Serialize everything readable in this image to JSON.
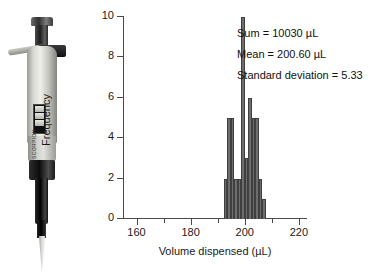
{
  "top_caption": "",
  "photo": {
    "name": "micropipette-photograph",
    "brand_text": "SCORPION",
    "display_label": "digital-volume-display"
  },
  "annotations": {
    "sum": "Sum = 10030 µL",
    "mean": "Mean = 200.60 µL",
    "std": "Standard deviation = 5.33"
  },
  "chart_data": {
    "type": "bar",
    "title": "",
    "xlabel": "Volume dispensed (µL)",
    "ylabel": "Frequency",
    "xlim": [
      155,
      223
    ],
    "ylim": [
      0,
      10
    ],
    "grid": false,
    "legend": null,
    "bar_color": "#6d6d6d",
    "bar_edge_color": "#3f3f3f",
    "x_ticks_major": [
      160,
      180,
      200,
      220
    ],
    "x_ticks_minor": [
      170,
      190,
      210
    ],
    "x_tick_labels": [
      "160",
      "180",
      "200",
      "220"
    ],
    "y_ticks": [
      0,
      2,
      4,
      6,
      8,
      10
    ],
    "y_tick_labels": [
      "0",
      "2",
      "4",
      "6",
      "8",
      "10"
    ],
    "bin_width": 1.3,
    "bin_starts": [
      192.2,
      193.5,
      194.8,
      196.1,
      197.4,
      198.7,
      200.0,
      201.3,
      202.6,
      203.9,
      205.2,
      206.5
    ],
    "bin_centers": [
      192.9,
      194.2,
      195.5,
      196.8,
      198.1,
      199.4,
      200.7,
      202.0,
      203.3,
      204.6,
      205.9,
      207.2
    ],
    "categories": [
      "192.9",
      "194.2",
      "195.5",
      "196.8",
      "198.1",
      "199.4",
      "200.7",
      "202.0",
      "203.3",
      "204.6",
      "205.9",
      "207.2"
    ],
    "values": [
      2,
      5,
      5,
      2,
      2,
      10,
      3,
      6,
      5,
      5,
      2,
      1
    ],
    "n_bins": 12,
    "annotations": [
      "Sum = 10030 µL",
      "Mean = 200.60 µL",
      "Standard deviation = 5.33"
    ]
  }
}
